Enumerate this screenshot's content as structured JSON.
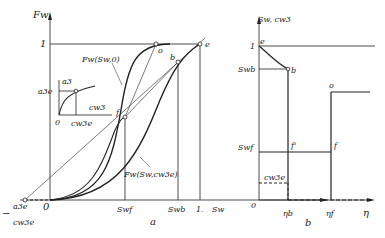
{
  "panel_a": {
    "caption": "a",
    "y_axis_label": "Fw",
    "x_axis_label": "Sw",
    "y_tick_one": "1",
    "origin": "0",
    "x_ticks": [
      "Swf",
      "Swb",
      "1."
    ],
    "left_tick_top": "a3e",
    "left_tick_bottom": "cw3e",
    "left_tick_sign": "−",
    "curve_upper_label": "Fw(Sw,0)",
    "curve_lower_label": "Fw(Sw,cw3e)",
    "points": [
      "o",
      "e",
      "b",
      "f"
    ],
    "inset": {
      "y_label": "a3",
      "x_label": "cw3",
      "y_tick": "a3e",
      "x_tick": "cw3e",
      "origin": "0"
    }
  },
  "panel_b": {
    "caption": "b",
    "y_axis_label": "Sw, cw3",
    "x_axis_label": "η",
    "y_ticks": [
      "1",
      "Swb",
      "Swf"
    ],
    "x_ticks": [
      "ηb",
      "ηf"
    ],
    "origin": "0",
    "conc_label": "cw3e",
    "points": [
      "e",
      "b",
      "f'",
      "o",
      "f"
    ]
  }
}
